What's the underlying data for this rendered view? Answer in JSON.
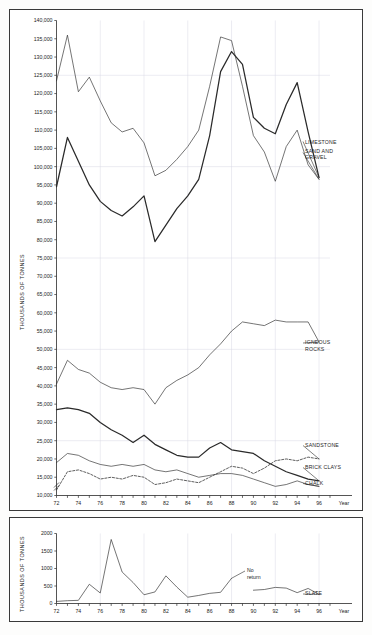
{
  "figure": {
    "background": "#fdfdfc",
    "line_color": "#2a2a2a",
    "grid_color": "#d9d9e4",
    "axis_color": "#2a2a2a"
  },
  "panels": {
    "top": {
      "y_axis_title": "THOUSANDS OF TONNES",
      "x_axis_title": "Year",
      "y_ticks": [
        "10,000",
        "15,000",
        "20,000",
        "25,000",
        "30,000",
        "35,000",
        "40,000",
        "45,000",
        "50,000",
        "55,000",
        "60,000",
        "65,000",
        "70,000",
        "75,000",
        "80,000",
        "85,000",
        "90,000",
        "95,000",
        "100,000",
        "105,000",
        "110,000",
        "115,000",
        "120,000",
        "125,000",
        "130,000",
        "135,000",
        "140,000"
      ],
      "x_ticks": [
        "72",
        "74",
        "76",
        "78",
        "80",
        "82",
        "84",
        "86",
        "88",
        "90",
        "92",
        "94",
        "96"
      ],
      "axis_break": true
    },
    "bottom": {
      "y_axis_title": "THOUSANDS OF TONNES",
      "x_axis_title": "Year",
      "y_ticks": [
        "0",
        "500",
        "1000",
        "1500",
        "2000"
      ],
      "x_ticks": [
        "72",
        "74",
        "76",
        "78",
        "80",
        "82",
        "84",
        "86",
        "88",
        "90",
        "92",
        "94",
        "96"
      ],
      "annotation": "No\nreturn",
      "annotation_line1": "No",
      "annotation_line2": "return"
    }
  },
  "series_labels": {
    "limestone": "LIMESTONE",
    "sand_and_gravel_line1": "SAND AND",
    "sand_and_gravel_line2": "GRAVEL",
    "igneous_line1": "IGNEOUS",
    "igneous_line2": "ROCKS",
    "sandstone": "SANDSTONE",
    "brick_clays": "BRICK CLAYS",
    "chalk": "CHALK",
    "slate": "SLATE"
  },
  "chart_data": [
    {
      "type": "line",
      "panel": "top",
      "title": "",
      "xlabel": "Year",
      "ylabel": "THOUSANDS OF TONNES",
      "xlim": [
        1972,
        1997
      ],
      "ylim": [
        10000,
        140000
      ],
      "grid": true,
      "legend_position": "right-inline-labels",
      "x": [
        1972,
        1973,
        1974,
        1975,
        1976,
        1977,
        1978,
        1979,
        1980,
        1981,
        1982,
        1983,
        1984,
        1985,
        1986,
        1987,
        1988,
        1989,
        1990,
        1991,
        1992,
        1993,
        1994,
        1995,
        1996
      ],
      "series": [
        {
          "name": "SAND AND GRAVEL",
          "style": "thin",
          "values": [
            123500,
            136000,
            120500,
            124500,
            118000,
            112000,
            109500,
            110500,
            106500,
            97500,
            99000,
            102000,
            105500,
            110000,
            122000,
            135500,
            134500,
            122000,
            108500,
            104000,
            96000,
            105500,
            110000,
            100500,
            96500
          ]
        },
        {
          "name": "LIMESTONE",
          "style": "thick",
          "values": [
            94500,
            108000,
            101500,
            95000,
            90500,
            88000,
            86500,
            89000,
            92000,
            79500,
            84000,
            88500,
            92000,
            96500,
            108500,
            126000,
            131500,
            128000,
            113500,
            110500,
            109000,
            117000,
            123000,
            109500,
            97000
          ]
        },
        {
          "name": "IGNEOUS ROCKS",
          "style": "thin",
          "values": [
            40500,
            47000,
            44500,
            43500,
            41000,
            39500,
            39000,
            39500,
            39000,
            35000,
            39500,
            41500,
            43000,
            45000,
            48500,
            51500,
            55000,
            57500,
            57000,
            56500,
            58000,
            57500,
            57500,
            57500,
            52000
          ]
        },
        {
          "name": "SANDSTONE",
          "style": "dashed",
          "values": [
            11500,
            16500,
            17000,
            16000,
            14500,
            15000,
            14500,
            15500,
            15000,
            13000,
            13500,
            14500,
            14000,
            13500,
            15000,
            16500,
            18000,
            17500,
            16000,
            17500,
            19500,
            20000,
            19500,
            20500,
            20000
          ]
        },
        {
          "name": "BRICK CLAYS",
          "style": "thick",
          "values": [
            33500,
            34000,
            33500,
            32500,
            30000,
            28000,
            26500,
            24500,
            26500,
            24000,
            22500,
            21000,
            20500,
            20500,
            23000,
            24500,
            22500,
            22000,
            21500,
            19500,
            18000,
            16500,
            15500,
            14500,
            14000
          ]
        },
        {
          "name": "CHALK",
          "style": "thin",
          "values": [
            19000,
            21500,
            21000,
            19500,
            18500,
            18000,
            18500,
            18000,
            18500,
            17000,
            16500,
            17000,
            16000,
            15000,
            15500,
            16000,
            16000,
            15500,
            14500,
            13500,
            12500,
            13000,
            14000,
            13000,
            12500
          ]
        }
      ]
    },
    {
      "type": "line",
      "panel": "bottom",
      "title": "",
      "xlabel": "Year",
      "ylabel": "THOUSANDS OF TONNES",
      "xlim": [
        1972,
        1997
      ],
      "ylim": [
        0,
        2000
      ],
      "grid": true,
      "annotation": "No return",
      "x": [
        1972,
        1973,
        1974,
        1975,
        1976,
        1977,
        1978,
        1979,
        1980,
        1981,
        1982,
        1983,
        1984,
        1985,
        1986,
        1987,
        1988,
        1990,
        1991,
        1992,
        1993,
        1994,
        1995,
        1996
      ],
      "series": [
        {
          "name": "SLATE",
          "style": "thin",
          "gap_after_year": 1988,
          "values": [
            60,
            80,
            90,
            550,
            300,
            1830,
            900,
            600,
            250,
            330,
            790,
            470,
            180,
            230,
            290,
            320,
            720,
            380,
            400,
            460,
            440,
            310,
            430,
            260
          ]
        }
      ]
    }
  ]
}
